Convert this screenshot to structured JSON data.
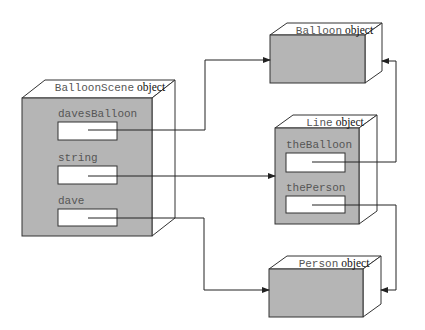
{
  "diagram": {
    "objects": [
      {
        "id": "balloonscene",
        "name": "BalloonScene",
        "kind": "object",
        "front": [
          22,
          98,
          152,
          236
        ],
        "depth": [
          23,
          -18
        ],
        "fields": [
          {
            "label": "davesBalloon",
            "box": [
              58,
              122,
              117,
              140
            ]
          },
          {
            "label": "string",
            "box": [
              58,
              166,
              117,
              184
            ]
          },
          {
            "label": "dave",
            "box": [
              58,
              209,
              117,
              226
            ]
          }
        ]
      },
      {
        "id": "balloon",
        "name": "Balloon",
        "kind": "object",
        "front": [
          270,
          35,
          365,
          83
        ],
        "depth": [
          17,
          -12
        ],
        "fields": []
      },
      {
        "id": "line",
        "name": "Line",
        "kind": "object",
        "front": [
          275,
          128,
          359,
          224
        ],
        "depth": [
          18,
          -13
        ],
        "fields": [
          {
            "label": "theBalloon",
            "box": [
              286,
              153,
              345,
              172
            ]
          },
          {
            "label": "thePerson",
            "box": [
              286,
              196,
              345,
              213
            ]
          }
        ]
      },
      {
        "id": "person",
        "name": "Person",
        "kind": "object",
        "front": [
          269,
          269,
          363,
          317
        ],
        "depth": [
          18,
          -13
        ],
        "fields": []
      }
    ],
    "references": [
      {
        "from": "BalloonScene.davesBalloon",
        "to": "Balloon object",
        "points": [
          [
            88,
            130
          ],
          [
            205,
            130
          ],
          [
            205,
            60
          ],
          [
            270,
            60
          ]
        ]
      },
      {
        "from": "BalloonScene.string",
        "to": "Line object",
        "points": [
          [
            88,
            176
          ],
          [
            275,
            176
          ]
        ]
      },
      {
        "from": "BalloonScene.dave",
        "to": "Person object",
        "points": [
          [
            88,
            218
          ],
          [
            204,
            218
          ],
          [
            204,
            290
          ],
          [
            269,
            290
          ]
        ]
      },
      {
        "from": "Line.theBalloon",
        "to": "Balloon object",
        "points": [
          [
            312,
            162
          ],
          [
            396,
            162
          ],
          [
            396,
            61
          ],
          [
            382,
            61
          ]
        ]
      },
      {
        "from": "Line.thePerson",
        "to": "Person object",
        "points": [
          [
            312,
            205
          ],
          [
            396,
            205
          ],
          [
            396,
            290
          ],
          [
            381,
            290
          ]
        ]
      }
    ],
    "colors": {
      "fill": "#b5b5b5",
      "stroke": "#333333",
      "label_class": "#555555",
      "label_object": "#111111"
    }
  }
}
